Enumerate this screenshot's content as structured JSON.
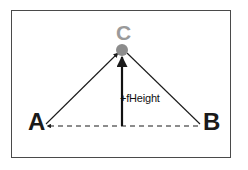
{
  "figure": {
    "name": "triangle-height-diagram",
    "background_color": "#ffffff",
    "frame_border_color": "#4a4a4a"
  },
  "labels": {
    "vertex_a": "A",
    "vertex_b": "B",
    "vertex_c": "C",
    "height_annotation": "+fHeight"
  },
  "colors": {
    "vertex_label_dark": "#1a1a1a",
    "vertex_label_c": "#9a9a9a",
    "apex_dot": "#8c8c8c",
    "line": "#1a1a1a",
    "annotation_text": "#111111"
  },
  "geometry": {
    "vertex_a_point": [
      46,
      126
    ],
    "vertex_b_point": [
      200,
      126
    ],
    "vertex_c_point": [
      122,
      50
    ],
    "apex_dot_radius": 6,
    "baseline_style": "dashed",
    "edge_style": "solid-with-arrowheads"
  }
}
